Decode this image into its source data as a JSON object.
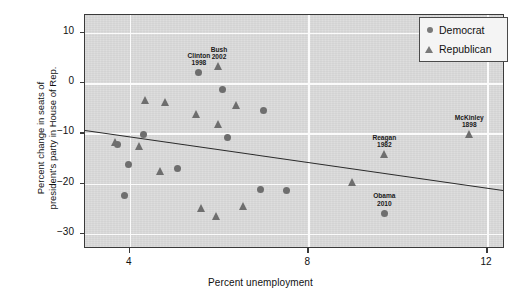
{
  "chart_data": {
    "type": "scatter",
    "title": "",
    "xlabel": "Percent unemployment",
    "ylabel": "Percent change in seats of president's party in House of Rep.",
    "ylabel_line1": "Percent change in seats of",
    "ylabel_line2": "president's party in House of Rep.",
    "xlim": [
      3.0,
      12.4
    ],
    "ylim": [
      -33.0,
      13.5
    ],
    "xticks": [
      4,
      8,
      12
    ],
    "yticks": [
      10,
      0,
      -10,
      -20,
      -30
    ],
    "xtick_labels": [
      "4",
      "8",
      "12"
    ],
    "ytick_labels": [
      "10",
      "0",
      "-10",
      "-20",
      "-30"
    ],
    "grid": true,
    "grid_color": "#fbfbfb",
    "plot_bg": "#dcdcdc",
    "marker_color": "#6e6e6e",
    "legend": {
      "position": "top-right",
      "entries": [
        {
          "label": "Democrat",
          "marker": "circle"
        },
        {
          "label": "Republican",
          "marker": "triangle"
        }
      ]
    },
    "trendline": {
      "x_start": 3.0,
      "y_start": -9.3,
      "x_end": 12.4,
      "y_end": -21.3,
      "color": "#2a2a2a"
    },
    "series": [
      {
        "name": "Democrat",
        "marker": "circle",
        "points": [
          {
            "x": 5.55,
            "y": 2.0,
            "label_name": "Clinton",
            "label_year": "1998"
          },
          {
            "x": 6.08,
            "y": -1.4,
            "label_name": "",
            "label_year": ""
          },
          {
            "x": 7.0,
            "y": -5.4,
            "label_name": "",
            "label_year": ""
          },
          {
            "x": 4.32,
            "y": -10.2,
            "label_name": "",
            "label_year": ""
          },
          {
            "x": 6.2,
            "y": -10.8,
            "label_name": "",
            "label_year": ""
          },
          {
            "x": 3.73,
            "y": -12.3,
            "label_name": "",
            "label_year": ""
          },
          {
            "x": 3.98,
            "y": -16.3,
            "label_name": "",
            "label_year": ""
          },
          {
            "x": 5.08,
            "y": -17.0,
            "label_name": "",
            "label_year": ""
          },
          {
            "x": 3.88,
            "y": -22.4,
            "label_name": "",
            "label_year": ""
          },
          {
            "x": 6.92,
            "y": -21.2,
            "label_name": "",
            "label_year": ""
          },
          {
            "x": 7.5,
            "y": -21.3,
            "label_name": "",
            "label_year": ""
          },
          {
            "x": 9.7,
            "y": -25.9,
            "label_name": "Obama",
            "label_year": "2010"
          }
        ]
      },
      {
        "name": "Republican",
        "marker": "triangle",
        "points": [
          {
            "x": 6.0,
            "y": 3.2,
            "label_name": "Bush",
            "label_year": "2002"
          },
          {
            "x": 4.35,
            "y": -3.4,
            "label_name": "",
            "label_year": ""
          },
          {
            "x": 4.8,
            "y": -3.9,
            "label_name": "",
            "label_year": ""
          },
          {
            "x": 5.5,
            "y": -6.2,
            "label_name": "",
            "label_year": ""
          },
          {
            "x": 6.4,
            "y": -4.4,
            "label_name": "",
            "label_year": ""
          },
          {
            "x": 5.98,
            "y": -8.2,
            "label_name": "",
            "label_year": ""
          },
          {
            "x": 3.68,
            "y": -11.9,
            "label_name": "",
            "label_year": ""
          },
          {
            "x": 4.22,
            "y": -12.6,
            "label_name": "",
            "label_year": ""
          },
          {
            "x": 4.7,
            "y": -17.5,
            "label_name": "",
            "label_year": ""
          },
          {
            "x": 5.6,
            "y": -25.0,
            "label_name": "",
            "label_year": ""
          },
          {
            "x": 5.95,
            "y": -26.6,
            "label_name": "",
            "label_year": ""
          },
          {
            "x": 6.55,
            "y": -24.5,
            "label_name": "",
            "label_year": ""
          },
          {
            "x": 8.98,
            "y": -19.8,
            "label_name": "",
            "label_year": ""
          },
          {
            "x": 9.7,
            "y": -14.3,
            "label_name": "Reagan",
            "label_year": "1982"
          },
          {
            "x": 11.6,
            "y": -10.3,
            "label_name": "McKinley",
            "label_year": "1898"
          }
        ]
      }
    ]
  }
}
